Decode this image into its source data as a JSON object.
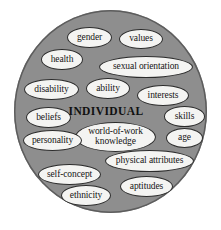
{
  "figure": {
    "background_color": "#ffffff",
    "circle_fill": "#8e8e8e",
    "circle_stroke": "#5d5d5d",
    "node_fill": "#f4f4f2",
    "node_stroke": "#2b2b2b",
    "text_color": "#151515"
  },
  "center": {
    "label": "INDIVIDUAL"
  },
  "nodes": [
    {
      "id": "gender",
      "label": "gender",
      "x": 67,
      "y": 27,
      "w": 45,
      "h": 21,
      "fs": 9.5
    },
    {
      "id": "values",
      "label": "values",
      "x": 119,
      "y": 29,
      "w": 44,
      "h": 20,
      "fs": 9.5
    },
    {
      "id": "health",
      "label": "health",
      "x": 41,
      "y": 49,
      "w": 42,
      "h": 21,
      "fs": 9.5
    },
    {
      "id": "sexual-orientation",
      "label": "sexual orientation",
      "x": 99,
      "y": 56,
      "w": 94,
      "h": 22,
      "fs": 9.5
    },
    {
      "id": "disability",
      "label": "disability",
      "x": 24,
      "y": 79,
      "w": 55,
      "h": 21,
      "fs": 9.5
    },
    {
      "id": "ability",
      "label": "ability",
      "x": 86,
      "y": 78,
      "w": 44,
      "h": 21,
      "fs": 9.5
    },
    {
      "id": "interests",
      "label": "interests",
      "x": 137,
      "y": 85,
      "w": 52,
      "h": 21,
      "fs": 9.5
    },
    {
      "id": "beliefs",
      "label": "beliefs",
      "x": 26,
      "y": 107,
      "w": 45,
      "h": 21,
      "fs": 9.5
    },
    {
      "id": "skills",
      "label": "skills",
      "x": 164,
      "y": 106,
      "w": 41,
      "h": 21,
      "fs": 9.5
    },
    {
      "id": "world-of-work-knowledge",
      "label": "world-of-work knowledge",
      "x": 75,
      "y": 122,
      "w": 81,
      "h": 30,
      "fs": 9.5
    },
    {
      "id": "age",
      "label": "age",
      "x": 166,
      "y": 128,
      "w": 37,
      "h": 20,
      "fs": 9.5
    },
    {
      "id": "personality",
      "label": "personality",
      "x": 23,
      "y": 130,
      "w": 59,
      "h": 21,
      "fs": 9.5
    },
    {
      "id": "physical-attributes",
      "label": "physical attributes",
      "x": 105,
      "y": 150,
      "w": 89,
      "h": 22,
      "fs": 9.5
    },
    {
      "id": "self-concept",
      "label": "self-concept",
      "x": 38,
      "y": 164,
      "w": 63,
      "h": 21,
      "fs": 9.5
    },
    {
      "id": "aptitudes",
      "label": "aptitudes",
      "x": 120,
      "y": 176,
      "w": 53,
      "h": 21,
      "fs": 9.5
    },
    {
      "id": "ethnicity",
      "label": "ethnicity",
      "x": 61,
      "y": 185,
      "w": 50,
      "h": 21,
      "fs": 9.5
    }
  ],
  "center_label_box": {
    "x": 62,
    "y": 102,
    "w": 88,
    "h": 18,
    "fs": 11.5
  }
}
